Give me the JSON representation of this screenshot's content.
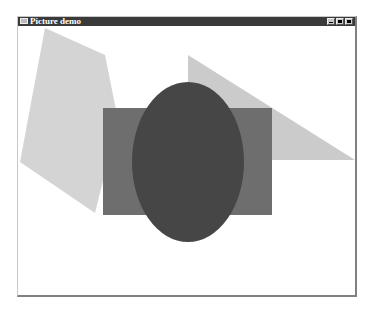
{
  "window": {
    "title": "Picture demo",
    "controls": [
      "minimize",
      "maximize",
      "close"
    ]
  },
  "canvas": {
    "shapes": [
      {
        "type": "polygon",
        "name": "light-polygon",
        "points": "45,28 105,55 118,120 95,213 20,162",
        "fill": "#d4d4d4"
      },
      {
        "type": "polygon",
        "name": "light-triangle",
        "points": "188,55 355,160 188,160",
        "fill": "#cbcbcb"
      },
      {
        "type": "rect",
        "name": "medium-rectangle",
        "x": 103,
        "y": 108,
        "width": 169,
        "height": 107,
        "fill": "#6e6e6e"
      },
      {
        "type": "ellipse",
        "name": "dark-ellipse",
        "cx": 188,
        "cy": 162,
        "rx": 56,
        "ry": 80,
        "fill": "#464646"
      }
    ]
  }
}
